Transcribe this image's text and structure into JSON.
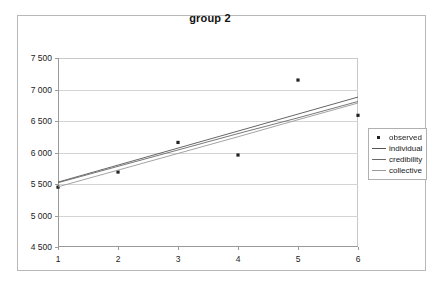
{
  "chart_data": {
    "type": "scatter",
    "title": "group 2",
    "xlabel": "",
    "ylabel": "",
    "xlim": [
      1,
      6
    ],
    "ylim": [
      4500,
      7500
    ],
    "ytick_labels": [
      "7 500",
      "7 000",
      "6 500",
      "6 000",
      "5 500",
      "5 000",
      "4 500"
    ],
    "ytick_values": [
      7500,
      7000,
      6500,
      6000,
      5500,
      5000,
      4500
    ],
    "xtick_labels": [
      "1",
      "2",
      "3",
      "4",
      "5",
      "6"
    ],
    "x": [
      1,
      2,
      3,
      4,
      5,
      6
    ],
    "grid": "horizontal",
    "legend_position": "right",
    "series": [
      {
        "name": "observed",
        "kind": "scatter",
        "marker": "square-dot",
        "color": "#222222",
        "values": [
          5450,
          5690,
          6160,
          5960,
          7150,
          6590
        ]
      },
      {
        "name": "individual",
        "kind": "line",
        "color": "#555555",
        "values": [
          5530,
          5800,
          6070,
          6340,
          6610,
          6880
        ]
      },
      {
        "name": "credibility",
        "kind": "line",
        "color": "#6a6a6a",
        "values": [
          5520,
          5780,
          6040,
          6300,
          6550,
          6810
        ]
      },
      {
        "name": "collective",
        "kind": "line",
        "color": "#9a9a9a",
        "values": [
          5455,
          5720,
          5985,
          6250,
          6520,
          6785
        ]
      }
    ]
  },
  "legend": {
    "entries": [
      {
        "label": "observed"
      },
      {
        "label": "individual"
      },
      {
        "label": "credibility"
      },
      {
        "label": "collective"
      }
    ]
  }
}
